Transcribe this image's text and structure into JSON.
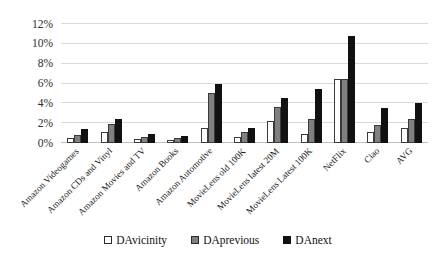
{
  "chart_data": {
    "type": "bar",
    "title": "",
    "subtitle": "",
    "xlabel": "",
    "ylabel": "",
    "ylim": [
      0,
      12
    ],
    "yticks": [
      0,
      2,
      4,
      6,
      8,
      10,
      12
    ],
    "ytick_labels": [
      "0%",
      "2%",
      "4%",
      "6%",
      "8%",
      "10%",
      "12%"
    ],
    "grid": true,
    "legend_position": "bottom",
    "value_unit": "%",
    "categories": [
      "Amazon Videogames",
      "Amazon CDs and Vinyl",
      "Amazon Movies and TV",
      "Amazon Books",
      "Amazon Automotive",
      "MovieLens old 100K",
      "MovieLens latest 20M",
      "MovieLens Latest 100K",
      "NetFlix",
      "Ciao",
      "AVG"
    ],
    "series": [
      {
        "name": "DAvicinity",
        "color": "#ffffff",
        "values": [
          0.5,
          1.1,
          0.4,
          0.3,
          1.5,
          0.6,
          2.2,
          0.9,
          6.5,
          1.1,
          1.5
        ]
      },
      {
        "name": "DAprevious",
        "color": "#808080",
        "values": [
          0.8,
          1.9,
          0.6,
          0.5,
          5.0,
          1.1,
          3.6,
          2.4,
          6.5,
          1.8,
          2.4
        ]
      },
      {
        "name": "DAnext",
        "color": "#111111",
        "values": [
          1.4,
          2.4,
          0.9,
          0.7,
          6.0,
          1.5,
          4.5,
          5.4,
          10.8,
          3.5,
          4.0
        ]
      }
    ]
  },
  "legend": {
    "items": [
      {
        "label": "DAvicinity",
        "swatch": "white-square-icon"
      },
      {
        "label": "DAprevious",
        "swatch": "gray-square-icon"
      },
      {
        "label": "DAnext",
        "swatch": "black-square-icon"
      }
    ]
  }
}
